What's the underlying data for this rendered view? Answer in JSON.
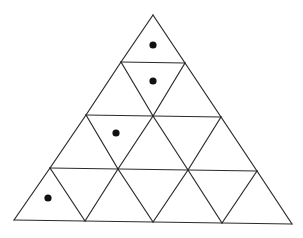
{
  "diagram": {
    "type": "triangular-grid",
    "rows": 4,
    "total_small_triangles": 16,
    "line_color": "#2b2b2b",
    "dot_color": "#111111",
    "background": "#ffffff",
    "vertices": {
      "row0": [
        [
          153,
          15
        ]
      ],
      "row1": [
        [
          121,
          62
        ],
        [
          185,
          63
        ]
      ],
      "row2": [
        [
          86,
          115
        ],
        [
          153,
          116
        ],
        [
          221,
          117
        ]
      ],
      "row3": [
        [
          50,
          168
        ],
        [
          118,
          169
        ],
        [
          188,
          170
        ],
        [
          257,
          171
        ]
      ],
      "row4": [
        [
          14,
          220
        ],
        [
          85,
          221
        ],
        [
          153,
          222
        ],
        [
          222,
          223
        ],
        [
          292,
          224
        ]
      ]
    },
    "dots": [
      {
        "cell": "row1-up-1",
        "x": 153,
        "y": 45
      },
      {
        "cell": "row2-down-1",
        "x": 153,
        "y": 81
      },
      {
        "cell": "row3-down-1",
        "x": 116,
        "y": 133
      },
      {
        "cell": "row4-up-1",
        "x": 48,
        "y": 198
      }
    ]
  }
}
